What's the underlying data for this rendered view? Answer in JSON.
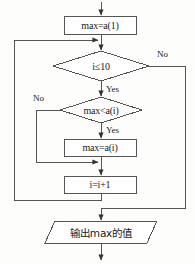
{
  "diagram": {
    "title": "",
    "type": "flowchart",
    "stroke_color": "#444444",
    "text_color": "#1a1a1a",
    "background_color": "#fdfdfb",
    "nodes": [
      {
        "id": "init",
        "shape": "process",
        "label": "max=a(1)",
        "x": 64,
        "y": 16,
        "w": 72,
        "h": 18
      },
      {
        "id": "cond_loop",
        "shape": "decision",
        "label": "i≤10",
        "cx": 101,
        "cy": 66,
        "w": 96,
        "h": 30
      },
      {
        "id": "cond_cmp",
        "shape": "decision",
        "label": "max<a(i)",
        "cx": 101,
        "cy": 110,
        "w": 82,
        "h": 26
      },
      {
        "id": "assign",
        "shape": "process",
        "label": "max=a(i)",
        "x": 64,
        "y": 139,
        "w": 72,
        "h": 17
      },
      {
        "id": "incr",
        "shape": "process",
        "label": "i=i+1",
        "x": 64,
        "y": 176,
        "w": 72,
        "h": 17
      },
      {
        "id": "output",
        "shape": "io",
        "label": "输出max的值",
        "cx": 101,
        "cy": 232,
        "w": 112,
        "h": 22,
        "skew": 10
      }
    ],
    "edge_labels": [
      {
        "id": "loop_no",
        "text": "No",
        "x": 157,
        "y": 49
      },
      {
        "id": "loop_yes",
        "text": "Yes",
        "x": 106,
        "y": 84
      },
      {
        "id": "cmp_no",
        "text": "No",
        "x": 33,
        "y": 93
      },
      {
        "id": "cmp_yes",
        "text": "Yes",
        "x": 106,
        "y": 125
      }
    ]
  }
}
